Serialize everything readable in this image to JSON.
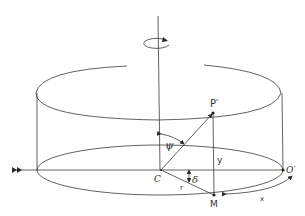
{
  "labels": {
    "P_prime": "P′",
    "C": "C",
    "M": "M",
    "O_prime": "O′",
    "psi": "ψ",
    "delta": "δ",
    "y": "y",
    "r": "r",
    "x": "x"
  },
  "icons": {
    "rotation": "rotation-arrow-icon",
    "incoming": "double-arrow-icon"
  },
  "colors": {
    "line": "#3a3a3a",
    "background": "#ffffff"
  }
}
